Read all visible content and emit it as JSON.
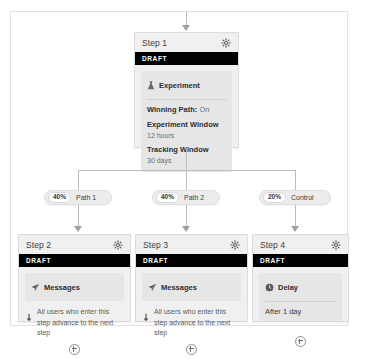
{
  "flow": {
    "entry_arrow_icon": "arrow-down-icon",
    "experiment_step": {
      "title": "Step 1",
      "status": "DRAFT",
      "gear_icon": "gear-icon",
      "block_icon": "flask-icon",
      "block_label": "Experiment",
      "winning_path_label": "Winning Path:",
      "winning_path_value": "On",
      "experiment_window_label": "Experiment Window",
      "experiment_window_value": "12 hours",
      "tracking_window_label": "Tracking Window",
      "tracking_window_value": "30 days"
    },
    "branches": [
      {
        "percent": "40%",
        "label": "Path 1"
      },
      {
        "percent": "40%",
        "label": "Path 2"
      },
      {
        "percent": "20%",
        "label": "Control"
      }
    ],
    "steps": [
      {
        "title": "Step 2",
        "status": "DRAFT",
        "gear_icon": "gear-icon",
        "block_icon": "send-icon",
        "block_label": "Messages",
        "note_icon": "arrow-down-icon",
        "note": "All users who enter this step advance to the next step",
        "add_icon": "plus-icon"
      },
      {
        "title": "Step 3",
        "status": "DRAFT",
        "gear_icon": "gear-icon",
        "block_icon": "send-icon",
        "block_label": "Messages",
        "note_icon": "arrow-down-icon",
        "note": "All users who enter this step advance to the next step",
        "add_icon": "plus-icon"
      },
      {
        "title": "Step 4",
        "status": "DRAFT",
        "gear_icon": "gear-icon",
        "block_icon": "clock-icon",
        "block_label": "Delay",
        "delay_value": "After 1 day",
        "add_icon": "plus-icon"
      }
    ]
  }
}
